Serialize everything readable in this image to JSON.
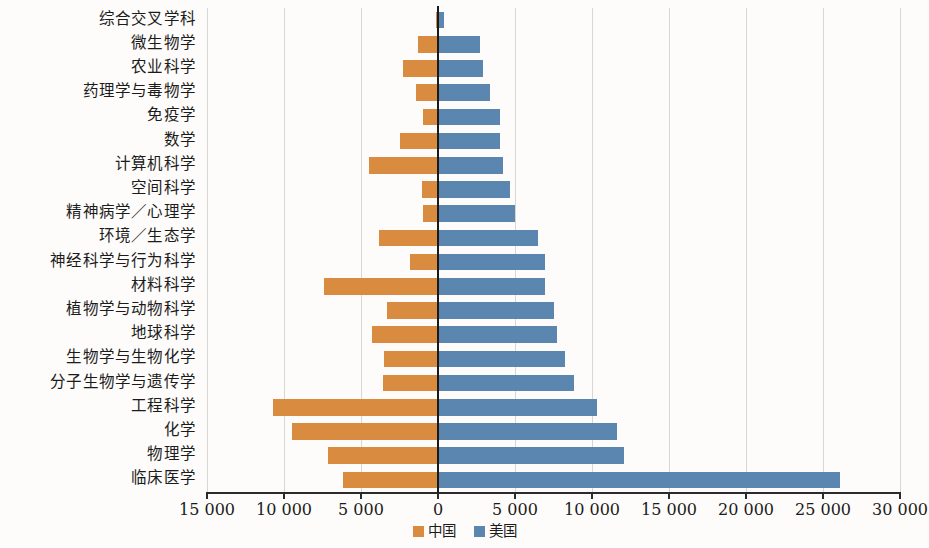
{
  "chart_data": {
    "type": "bar",
    "orientation": "horizontal",
    "variant": "diverging-population-pyramid",
    "title": "",
    "xlabel": "",
    "ylabel": "",
    "xlim": [
      -15000,
      30000
    ],
    "xticks": [
      -15000,
      -10000,
      -5000,
      0,
      5000,
      10000,
      15000,
      20000,
      25000,
      30000
    ],
    "xticklabels": [
      "15 000",
      "10 000",
      "5 000",
      "0",
      "5 000",
      "10 000",
      "15 000",
      "20 000",
      "25 000",
      "30 000"
    ],
    "grid": true,
    "grid_axis": "x",
    "legend_position": "bottom-center",
    "colors": {
      "china": "#d98c3f",
      "usa": "#5b86b0",
      "zero_line": "#1a1a1a",
      "grid": "#d8d6d2"
    },
    "categories": [
      "综合交叉学科",
      "微生物学",
      "农业科学",
      "药理学与毒物学",
      "免疫学",
      "数学",
      "计算机科学",
      "空间科学",
      "精神病学／心理学",
      "环境／生态学",
      "神经科学与行为科学",
      "材料科学",
      "植物学与动物科学",
      "地球科学",
      "生物学与生物化学",
      "分子生物学与遗传学",
      "工程科学",
      "化学",
      "物理学",
      "临床医学"
    ],
    "series": [
      {
        "name": "中国",
        "key": "china",
        "side": "left",
        "color": "#d98c3f",
        "values": [
          150,
          1300,
          2250,
          1450,
          950,
          2450,
          4500,
          1050,
          950,
          3850,
          1800,
          7400,
          3300,
          4300,
          3500,
          3600,
          10700,
          9500,
          7150,
          6200
        ]
      },
      {
        "name": "美国",
        "key": "usa",
        "side": "right",
        "color": "#5b86b0",
        "values": [
          400,
          2700,
          2950,
          3400,
          4050,
          4050,
          4250,
          4700,
          5000,
          6500,
          6950,
          6950,
          7550,
          7750,
          8250,
          8850,
          10300,
          11650,
          12050,
          26100
        ]
      }
    ]
  },
  "legend": {
    "items": [
      {
        "label": "中国",
        "color": "#d98c3f"
      },
      {
        "label": "美国",
        "color": "#5b86b0"
      }
    ]
  }
}
